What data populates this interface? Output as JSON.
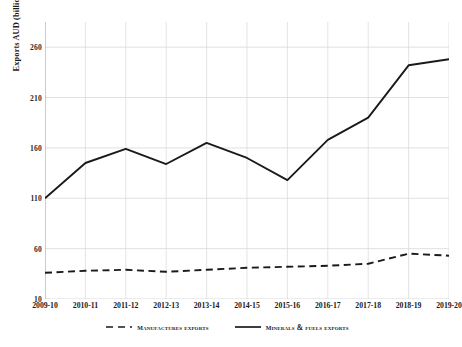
{
  "chart_data": {
    "type": "line",
    "title": "",
    "xlabel": "",
    "ylabel": "Exports AUD (billion)",
    "categories": [
      "2009-10",
      "2010-11",
      "2011-12",
      "2012-13",
      "2013-14",
      "2014-15",
      "2015-16",
      "2016-17",
      "2017-18",
      "2018-19",
      "2019-20"
    ],
    "ylim": [
      10,
      285
    ],
    "yticks": [
      10,
      60,
      110,
      160,
      210,
      260
    ],
    "ytick_labels": [
      "10",
      "60",
      "110",
      "160",
      "210",
      "260"
    ],
    "grid": "horizontal-and-vertical",
    "legend_position": "bottom-center",
    "series": [
      {
        "name": "Manufactures exports",
        "style": "dashed",
        "color": "#1a1a1a",
        "values": [
          36,
          38,
          39,
          37,
          39,
          41,
          42,
          43,
          45,
          55,
          53
        ]
      },
      {
        "name": "Minerals & fuels exports",
        "style": "solid",
        "color": "#1a1a1a",
        "values": [
          110,
          145,
          159,
          144,
          165,
          150,
          128,
          168,
          190,
          242,
          248
        ]
      }
    ]
  },
  "axis": {
    "y_title": "Exports AUD (billion)",
    "y_tick_labels": [
      "260",
      "210",
      "160",
      "110",
      "60",
      "10"
    ],
    "x_tick_labels": [
      "2009-10",
      "2010-11",
      "2011-12",
      "2012-13",
      "2013-14",
      "2014-15",
      "2015-16",
      "2016-17",
      "2017-18",
      "2018-19",
      "2019-20"
    ]
  },
  "legend": {
    "items": [
      {
        "label": "Manufactures exports",
        "style": "dashed"
      },
      {
        "label": "Minerals & fuels exports",
        "style": "solid"
      }
    ]
  },
  "colors": {
    "line": "#1a1a1a",
    "grid": "#d9d9d9",
    "axis": "#bfbfbf",
    "background": "#ffffff"
  }
}
